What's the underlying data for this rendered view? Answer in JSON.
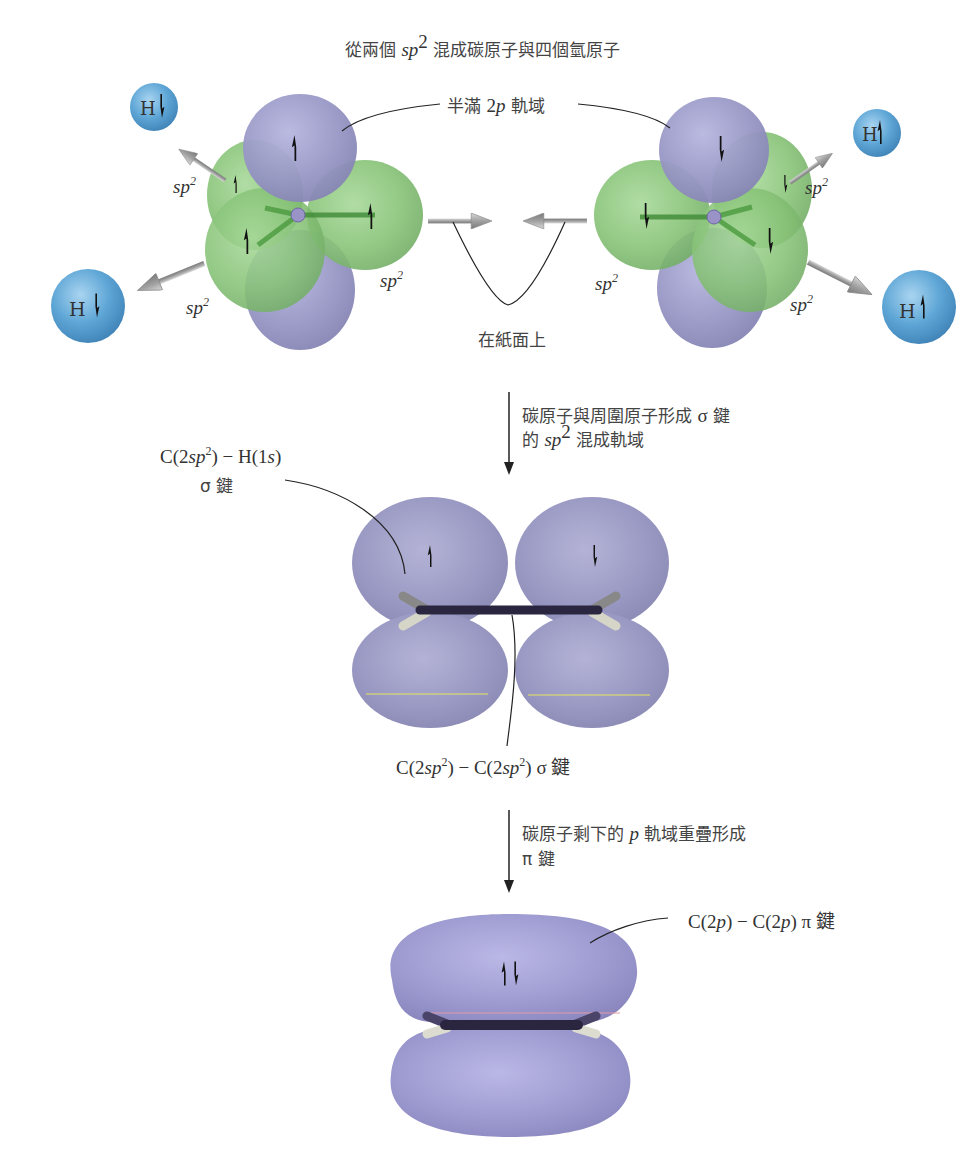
{
  "title": {
    "prefix": "從兩個 ",
    "sp": "sp",
    "sup": "2",
    "suffix": " 混成碳原子與四個氫原子"
  },
  "stage1": {
    "half_filled_label": {
      "prefix": "半滿 ",
      "orb": "2",
      "orb_it": "p",
      "suffix": " 軌域"
    },
    "in_plane_label": "在紙面上",
    "hybrid_label": {
      "base": "sp",
      "sup": "2"
    },
    "hydrogen_label": "H",
    "colors": {
      "sp2_lobe": "#8cc67a",
      "p_lobe": "#9d9cc9",
      "hydrogen": "#5ea6d6",
      "arrow": "#a8a8a8"
    }
  },
  "step1": {
    "line1_prefix": "碳原子與周圍原子形成 ",
    "line1_sym": "σ",
    "line1_suffix": " 鍵",
    "line2_prefix": "的 ",
    "line2_sp": "sp",
    "line2_sup": "2",
    "line2_suffix": " 混成軌域"
  },
  "stage2": {
    "ch_label": {
      "c": "C(2",
      "sp": "sp",
      "sup": "2",
      "mid": ") − H(1",
      "s": "s",
      "end": ")"
    },
    "ch_label_line2": "σ 鍵",
    "cc_label": {
      "a": "C(2",
      "sp1": "sp",
      "sup1": "2",
      "b": ") − C(2",
      "sp2": "sp",
      "sup2": "2",
      "c": ") σ 鍵"
    },
    "colors": {
      "p_lobe": "#9a9ac4",
      "bond": "#2a2640"
    }
  },
  "step2": {
    "line1_prefix": "碳原子剩下的 ",
    "line1_p": "p",
    "line1_suffix": " 軌域重疊形成",
    "line2": "π 鍵"
  },
  "stage3": {
    "pi_label": {
      "a": "C(2",
      "p1": "p",
      "b": ") − C(2",
      "p2": "p",
      "c": ") π 鍵"
    },
    "colors": {
      "pi_lobe": "#9e9bd1"
    }
  }
}
